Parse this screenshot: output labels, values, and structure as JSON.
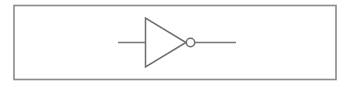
{
  "figure": {
    "name": "logic-inverter-symbol",
    "canvas": {
      "width": 352,
      "height": 87
    },
    "background_color": "#ffffff"
  },
  "frame": {
    "name": "diagram-border",
    "x": 14,
    "y": 5.5,
    "width": 322,
    "height": 74,
    "stroke_color": "#8a8a8a",
    "stroke_width": 1.6,
    "fill_color": "#ffffff"
  },
  "gate": {
    "type": "inverter",
    "label": "NOT",
    "triangle": {
      "name": "inverter-triangle",
      "points": "145.5,18 145.5,67 186,42.5",
      "stroke_color": "#6e6e6e",
      "stroke_width": 1.5,
      "fill_color": "#ffffff"
    },
    "bubble": {
      "name": "inversion-bubble",
      "cx": 190.5,
      "cy": 42.5,
      "r": 4.2,
      "stroke_color": "#6e6e6e",
      "stroke_width": 1.5,
      "fill_color": "#ffffff"
    }
  },
  "wires": [
    {
      "name": "input-wire",
      "x1": 118,
      "y1": 42.5,
      "x2": 145.5,
      "y2": 42.5,
      "stroke_color": "#777777",
      "stroke_width": 1.5
    },
    {
      "name": "output-wire",
      "x1": 194.7,
      "y1": 42.5,
      "x2": 236,
      "y2": 42.5,
      "stroke_color": "#777777",
      "stroke_width": 1.5
    }
  ],
  "colors": {
    "line": "#6e6e6e",
    "wire": "#777777",
    "frame": "#8a8a8a",
    "background": "#ffffff"
  }
}
